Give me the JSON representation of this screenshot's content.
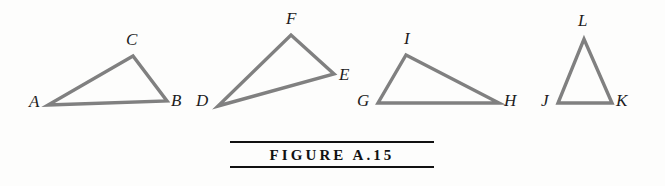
{
  "figure": {
    "caption": "FIGURE  A.15",
    "caption_rule_color": "#111111",
    "stroke_color": "#808080",
    "label_color": "#1c1c1c",
    "background_color": "#fdfdfc"
  },
  "triangles": [
    {
      "name": "triangle-abc",
      "points": "48,105 167,101 133,56",
      "labels": [
        {
          "text": "A",
          "left": 29,
          "top": 93
        },
        {
          "text": "B",
          "left": 171,
          "top": 92
        },
        {
          "text": "C",
          "left": 126,
          "top": 31
        }
      ]
    },
    {
      "name": "triangle-def",
      "points": "218,106 334,74 291,35",
      "labels": [
        {
          "text": "D",
          "left": 196,
          "top": 92
        },
        {
          "text": "E",
          "left": 339,
          "top": 66
        },
        {
          "text": "F",
          "left": 286,
          "top": 10
        }
      ]
    },
    {
      "name": "triangle-ghi",
      "points": "378,103 499,103 406,55",
      "labels": [
        {
          "text": "G",
          "left": 357,
          "top": 92
        },
        {
          "text": "H",
          "left": 504,
          "top": 92
        },
        {
          "text": "I",
          "left": 404,
          "top": 30
        }
      ]
    },
    {
      "name": "triangle-jkl",
      "points": "558,103 612,103 584,39",
      "labels": [
        {
          "text": "J",
          "left": 541,
          "top": 92
        },
        {
          "text": "K",
          "left": 616,
          "top": 92
        },
        {
          "text": "L",
          "left": 578,
          "top": 12
        }
      ]
    }
  ]
}
